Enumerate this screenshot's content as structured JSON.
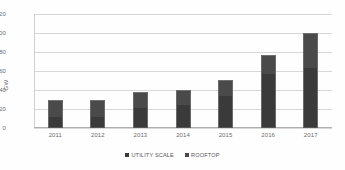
{
  "chart_data": {
    "type": "bar",
    "stacked": true,
    "title": "",
    "xlabel": "",
    "ylabel": "GW",
    "ylim": [
      0,
      120
    ],
    "yticks": [
      0,
      20,
      40,
      60,
      80,
      100,
      120
    ],
    "grid": true,
    "legend_position": "bottom",
    "categories": [
      "2011",
      "2012",
      "2013",
      "2014",
      "2015",
      "2016",
      "2017"
    ],
    "series": [
      {
        "name": "UTILITY SCALE",
        "color": "#3a3a3a",
        "values": [
          12,
          12,
          21,
          24,
          34,
          57,
          63
        ]
      },
      {
        "name": "ROOFTOP",
        "color": "#4a4a4a",
        "values": [
          18,
          17,
          17,
          16,
          17,
          20,
          37
        ]
      }
    ],
    "totals": [
      30,
      29,
      38,
      40,
      51,
      77,
      100
    ]
  },
  "legend": {
    "items": [
      {
        "label": "UTILITY SCALE",
        "swatch": "#3a3a3a"
      },
      {
        "label": "ROOFTOP",
        "swatch": "#4a4a4a"
      }
    ]
  }
}
